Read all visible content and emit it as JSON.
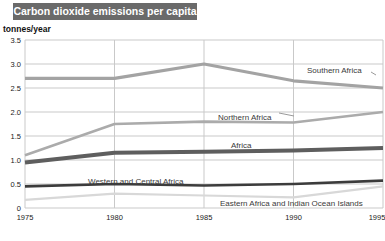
{
  "header": {
    "title": "Carbon dioxide emissions per capita"
  },
  "chart_data": {
    "type": "line",
    "title": "Carbon dioxide emissions per capita",
    "ylabel": "tonnes/year",
    "xlabel": "",
    "ylim": [
      0,
      3.5
    ],
    "grid": true,
    "legend_position": "inline-labels",
    "x": [
      1975,
      1980,
      1985,
      1990,
      1995
    ],
    "x_tick_labels": [
      "1975",
      "1980",
      "1985",
      "1990",
      "1995"
    ],
    "y_ticks": [
      {
        "value": 0,
        "label": "0"
      },
      {
        "value": 0.5,
        "label": "0.5"
      },
      {
        "value": 1.0,
        "label": "1.0"
      },
      {
        "value": 1.5,
        "label": "1.5"
      },
      {
        "value": 2.0,
        "label": "2.0"
      },
      {
        "value": 2.5,
        "label": "2.5"
      },
      {
        "value": 3.0,
        "label": "3.0"
      },
      {
        "value": 3.5,
        "label": "3.5"
      }
    ],
    "series": [
      {
        "name": "Southern Africa",
        "values": [
          2.7,
          2.7,
          3.0,
          2.65,
          2.5
        ],
        "color": "#a3a3a3",
        "width": 3.2,
        "label": {
          "x": 307,
          "y": 73
        },
        "leader": {
          "x1": 371,
          "y1": 72,
          "x2": 376,
          "y2": 75
        }
      },
      {
        "name": "Northern Africa",
        "values": [
          1.1,
          1.75,
          1.8,
          1.78,
          2.0
        ],
        "color": "#ababab",
        "width": 2.6,
        "label": {
          "x": 218,
          "y": 120
        },
        "leader": {
          "x1": 279,
          "y1": 113,
          "x2": 294,
          "y2": 116
        }
      },
      {
        "name": "Africa",
        "values": [
          0.95,
          1.15,
          1.17,
          1.2,
          1.25
        ],
        "color": "#5e5e5e",
        "width": 4,
        "label": {
          "x": 231,
          "y": 148
        }
      },
      {
        "name": "Western and Central Africa",
        "values": [
          0.45,
          0.5,
          0.47,
          0.5,
          0.57
        ],
        "color": "#3c3c3c",
        "width": 2.6,
        "label": {
          "x": 88,
          "y": 184
        }
      },
      {
        "name": "Eastern Africa and Indian Ocean Islands",
        "values": [
          0.17,
          0.3,
          0.26,
          0.22,
          0.45
        ],
        "color": "#d8d8d8",
        "width": 2.2,
        "label": {
          "x": 220,
          "y": 206
        }
      }
    ],
    "colors": {
      "title_bar_bg": "#6a6a6a",
      "title_text": "#ffffff",
      "grid": "#c9c9c9",
      "tick_text": "#1a1a1a",
      "series_label_text": "#3a3a3a",
      "leader": "#9a9a9a",
      "background": "#ffffff"
    }
  }
}
